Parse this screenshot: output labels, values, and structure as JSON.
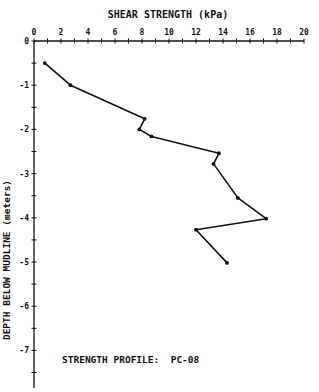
{
  "chart_data": {
    "type": "line",
    "title": "SHEAR STRENGTH (kPa)",
    "xlabel": "SHEAR STRENGTH (kPa)",
    "ylabel": "DEPTH BELOW MUDLINE (meters)",
    "annotation": "STRENGTH PROFILE:  PC-08",
    "x_ticks": [
      0,
      2,
      4,
      6,
      8,
      10,
      12,
      14,
      16,
      18,
      20
    ],
    "y_ticks": [
      0,
      -1,
      -2,
      -3,
      -4,
      -5,
      -6,
      -7
    ],
    "xlim": [
      0,
      20
    ],
    "ylim": [
      -7.9,
      0
    ],
    "grid": false,
    "legend": "none",
    "x_axis_position": "top",
    "series": [
      {
        "name": "PC-08",
        "x": [
          0.8,
          2.7,
          8.2,
          7.8,
          8.7,
          13.7,
          13.3,
          15.1,
          17.2,
          12.0,
          14.3
        ],
        "y": [
          -0.5,
          -1.0,
          -1.76,
          -2.0,
          -2.16,
          -2.54,
          -2.78,
          -3.55,
          -4.02,
          -4.27,
          -5.02
        ]
      }
    ]
  },
  "colors": {
    "ink": "#111111",
    "background": "#ffffff"
  }
}
